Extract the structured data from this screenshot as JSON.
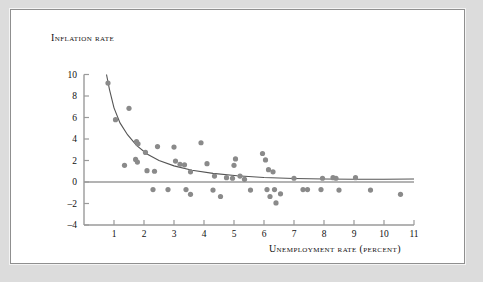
{
  "figure": {
    "y_axis_title": "Inflation rate",
    "x_axis_title": "Unemployment rate (percent)",
    "dot_color": "#8a8a8a",
    "curve_color": "#555555",
    "axis_color": "#9a9a9a",
    "frame_color": "#dcdcdc",
    "panel_color": "#ffffff"
  },
  "chart_data": {
    "type": "scatter",
    "title": "",
    "xlabel": "Unemployment rate (percent)",
    "ylabel": "Inflation rate",
    "xlim": [
      0,
      11
    ],
    "ylim": [
      -4,
      10
    ],
    "xticks": [
      1,
      2,
      3,
      4,
      5,
      6,
      7,
      8,
      9,
      10,
      11
    ],
    "yticks": [
      -4,
      -2,
      0,
      2,
      4,
      6,
      8,
      10
    ],
    "grid": false,
    "legend": false,
    "zero_line": true,
    "points": [
      [
        0.8,
        9.2
      ],
      [
        1.05,
        5.8
      ],
      [
        1.5,
        6.85
      ],
      [
        1.75,
        3.75
      ],
      [
        1.8,
        3.55
      ],
      [
        1.72,
        2.1
      ],
      [
        1.78,
        1.85
      ],
      [
        1.35,
        1.55
      ],
      [
        2.05,
        2.75
      ],
      [
        2.1,
        1.05
      ],
      [
        2.35,
        1.0
      ],
      [
        2.45,
        3.3
      ],
      [
        2.3,
        -0.7
      ],
      [
        2.8,
        -0.7
      ],
      [
        3.0,
        3.25
      ],
      [
        3.05,
        1.95
      ],
      [
        3.2,
        1.65
      ],
      [
        3.35,
        1.6
      ],
      [
        3.55,
        0.95
      ],
      [
        3.4,
        -0.7
      ],
      [
        3.55,
        -1.15
      ],
      [
        3.9,
        3.65
      ],
      [
        4.1,
        1.7
      ],
      [
        4.35,
        0.55
      ],
      [
        4.3,
        -0.75
      ],
      [
        4.55,
        -1.35
      ],
      [
        4.75,
        0.4
      ],
      [
        4.95,
        0.35
      ],
      [
        5.0,
        1.55
      ],
      [
        5.05,
        2.15
      ],
      [
        5.2,
        0.55
      ],
      [
        5.35,
        0.25
      ],
      [
        5.55,
        -0.75
      ],
      [
        5.95,
        2.65
      ],
      [
        6.05,
        2.05
      ],
      [
        6.15,
        1.15
      ],
      [
        6.3,
        0.95
      ],
      [
        6.1,
        -0.7
      ],
      [
        6.35,
        -0.7
      ],
      [
        6.2,
        -1.35
      ],
      [
        6.4,
        -1.95
      ],
      [
        6.55,
        -1.1
      ],
      [
        7.0,
        0.35
      ],
      [
        7.3,
        -0.7
      ],
      [
        7.45,
        -0.7
      ],
      [
        7.9,
        -0.7
      ],
      [
        7.95,
        0.35
      ],
      [
        8.3,
        0.4
      ],
      [
        8.4,
        0.35
      ],
      [
        8.5,
        -0.75
      ],
      [
        9.05,
        0.4
      ],
      [
        9.55,
        -0.75
      ],
      [
        10.55,
        -1.15
      ]
    ],
    "fit_curve": {
      "description": "decaying Phillips curve fit",
      "points": [
        [
          0.75,
          10.0
        ],
        [
          0.85,
          8.6
        ],
        [
          1.0,
          6.9
        ],
        [
          1.2,
          5.5
        ],
        [
          1.45,
          4.4
        ],
        [
          1.75,
          3.4
        ],
        [
          2.1,
          2.6
        ],
        [
          2.5,
          2.0
        ],
        [
          3.0,
          1.5
        ],
        [
          3.6,
          1.1
        ],
        [
          4.3,
          0.8
        ],
        [
          5.1,
          0.58
        ],
        [
          6.0,
          0.42
        ],
        [
          7.0,
          0.33
        ],
        [
          8.0,
          0.28
        ],
        [
          9.0,
          0.26
        ],
        [
          10.0,
          0.26
        ],
        [
          11.0,
          0.28
        ]
      ]
    },
    "horizontal_line": {
      "y": 0,
      "x_from": 0,
      "x_to": 11
    }
  }
}
